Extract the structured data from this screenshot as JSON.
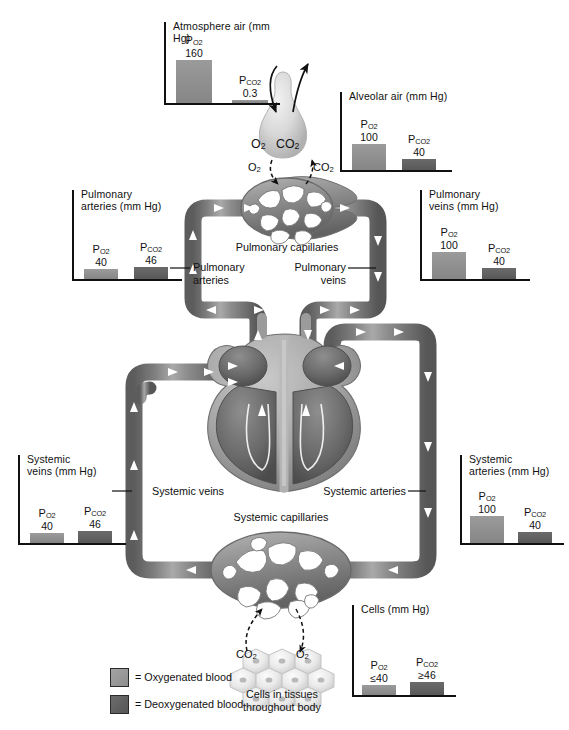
{
  "colors": {
    "oxygenated": "#8f8f8f",
    "deoxygenated": "#5f5f5f",
    "vessel_light": "#9a9a9a",
    "vessel_dark": "#5a5a5a",
    "text": "#111111",
    "background": "#ffffff"
  },
  "chart_scale_max": 170,
  "charts": [
    {
      "id": "atmosphere-air",
      "title": "Atmosphere air (mm Hg)",
      "bars": [
        {
          "label": "P",
          "sub": "O",
          "sub2": "2",
          "value_text": "160",
          "value": 160,
          "type": "oxygenated"
        },
        {
          "label": "P",
          "sub": "CO",
          "sub2": "2",
          "value_text": "0.3",
          "value": 0.3,
          "type": "oxygenated"
        }
      ]
    },
    {
      "id": "alveolar-air",
      "title": "Alveolar air (mm Hg)",
      "bars": [
        {
          "label": "P",
          "sub": "O",
          "sub2": "2",
          "value_text": "100",
          "value": 100,
          "type": "oxygenated"
        },
        {
          "label": "P",
          "sub": "CO",
          "sub2": "2",
          "value_text": "40",
          "value": 40,
          "type": "deoxygenated"
        }
      ]
    },
    {
      "id": "pulmonary-arteries",
      "title": "Pulmonary\narteries (mm Hg)",
      "bars": [
        {
          "label": "P",
          "sub": "O",
          "sub2": "2",
          "value_text": "40",
          "value": 40,
          "type": "oxygenated"
        },
        {
          "label": "P",
          "sub": "CO",
          "sub2": "2",
          "value_text": "46",
          "value": 46,
          "type": "deoxygenated"
        }
      ]
    },
    {
      "id": "pulmonary-veins",
      "title": "Pulmonary\nveins (mm Hg)",
      "bars": [
        {
          "label": "P",
          "sub": "O",
          "sub2": "2",
          "value_text": "100",
          "value": 100,
          "type": "oxygenated"
        },
        {
          "label": "P",
          "sub": "CO",
          "sub2": "2",
          "value_text": "40",
          "value": 40,
          "type": "deoxygenated"
        }
      ]
    },
    {
      "id": "systemic-veins",
      "title": "Systemic\nveins (mm Hg)",
      "bars": [
        {
          "label": "P",
          "sub": "O",
          "sub2": "2",
          "value_text": "40",
          "value": 40,
          "type": "oxygenated"
        },
        {
          "label": "P",
          "sub": "CO",
          "sub2": "2",
          "value_text": "46",
          "value": 46,
          "type": "deoxygenated"
        }
      ]
    },
    {
      "id": "systemic-arteries",
      "title": "Systemic\narteries (mm Hg)",
      "bars": [
        {
          "label": "P",
          "sub": "O",
          "sub2": "2",
          "value_text": "100",
          "value": 100,
          "type": "oxygenated"
        },
        {
          "label": "P",
          "sub": "CO",
          "sub2": "2",
          "value_text": "40",
          "value": 40,
          "type": "deoxygenated"
        }
      ]
    },
    {
      "id": "cells",
      "title": "Cells (mm Hg)",
      "bars": [
        {
          "label": "P",
          "sub": "O",
          "sub2": "2",
          "value_text": "≤40",
          "value": 40,
          "type": "oxygenated"
        },
        {
          "label": "P",
          "sub": "CO",
          "sub2": "2",
          "value_text": "≥46",
          "value": 46,
          "type": "deoxygenated"
        }
      ]
    }
  ],
  "diagram_labels": {
    "pulmonary_capillaries": "Pulmonary capillaries",
    "pulmonary_arteries": "Pulmonary\narteries",
    "pulmonary_veins": "Pulmonary\nveins",
    "systemic_veins": "Systemic veins",
    "systemic_arteries": "Systemic arteries",
    "systemic_capillaries": "Systemic capillaries",
    "cells_in_tissues": "Cells in tissues\nthroughout body"
  },
  "gas_labels": {
    "alveolus_o2": "O",
    "alveolus_o2_sub": "2",
    "alveolus_co2": "CO",
    "alveolus_co2_sub": "2",
    "lung_o2_in": "O",
    "lung_o2_in_sub": "2",
    "lung_co2_out": "CO",
    "lung_co2_out_sub": "2",
    "tissue_co2": "CO",
    "tissue_co2_sub": "2",
    "tissue_o2": "O",
    "tissue_o2_sub": "2"
  },
  "legend": {
    "items": [
      {
        "swatch": "oxygenated",
        "text": "= Oxygenated blood"
      },
      {
        "swatch": "deoxygenated",
        "text": "= Deoxygenated blood"
      }
    ]
  }
}
